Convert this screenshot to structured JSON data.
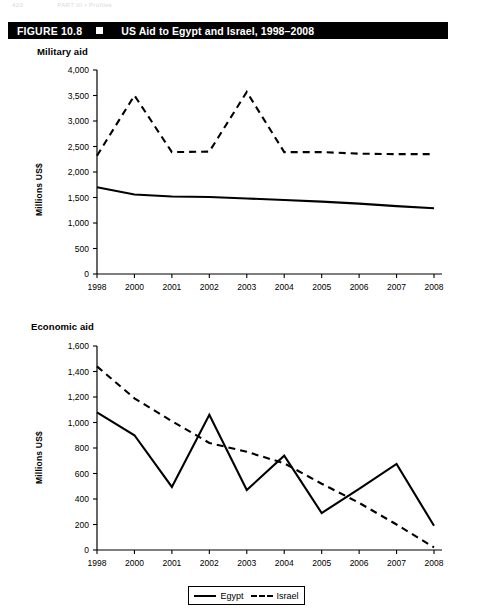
{
  "running_head": {
    "page": "420",
    "text": "PART III  •  Profiles"
  },
  "figure": {
    "number": "FIGURE 10.8",
    "marker": "black-square-bullet",
    "title": "US Aid to Egypt and Israel, 1998–2008"
  },
  "legend": {
    "items": [
      {
        "label": "Egypt",
        "style": "solid"
      },
      {
        "label": "Israel",
        "style": "dashed"
      }
    ]
  },
  "chart_data": [
    {
      "type": "line",
      "title": "Military aid",
      "xlabel": "",
      "ylabel": "Millions US$",
      "x": [
        "1998",
        "2000",
        "2001",
        "2002",
        "2003",
        "2004",
        "2005",
        "2006",
        "2007",
        "2008"
      ],
      "ylim": [
        0,
        4000
      ],
      "yticks": [
        "0",
        "500",
        "1,000",
        "1,500",
        "2,000",
        "2,500",
        "3,000",
        "3,500",
        "4,000"
      ],
      "ytick_values": [
        0,
        500,
        1000,
        1500,
        2000,
        2500,
        3000,
        3500,
        4000
      ],
      "grid": false,
      "legend_position": "bottom",
      "series": [
        {
          "name": "Egypt",
          "style": "solid",
          "values": [
            1700,
            1560,
            1520,
            1510,
            1480,
            1450,
            1420,
            1380,
            1330,
            1290
          ]
        },
        {
          "name": "Israel",
          "style": "dashed",
          "values": [
            2320,
            3500,
            2390,
            2400,
            3570,
            2390,
            2390,
            2360,
            2350,
            2350
          ]
        }
      ]
    },
    {
      "type": "line",
      "title": "Economic aid",
      "xlabel": "",
      "ylabel": "Millions US$",
      "x": [
        "1998",
        "2000",
        "2001",
        "2002",
        "2003",
        "2004",
        "2005",
        "2006",
        "2007",
        "2008"
      ],
      "ylim": [
        0,
        1600
      ],
      "yticks": [
        "0",
        "200",
        "400",
        "600",
        "800",
        "1,000",
        "1,200",
        "1,400",
        "1,600"
      ],
      "ytick_values": [
        0,
        200,
        400,
        600,
        800,
        1000,
        1200,
        1400,
        1600
      ],
      "grid": false,
      "legend_position": "bottom",
      "series": [
        {
          "name": "Egypt",
          "style": "solid",
          "values": [
            1080,
            900,
            495,
            1060,
            470,
            740,
            290,
            480,
            675,
            190
          ]
        },
        {
          "name": "Israel",
          "style": "dashed",
          "values": [
            1440,
            1190,
            1010,
            840,
            770,
            680,
            520,
            370,
            200,
            20
          ]
        }
      ]
    }
  ]
}
